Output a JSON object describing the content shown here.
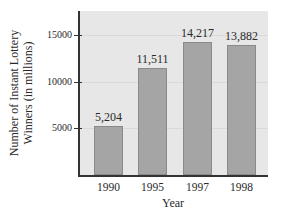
{
  "chart_data": {
    "type": "bar",
    "title": "",
    "xlabel": "Year",
    "ylabel": "Number of Instant Lottery Winners (in millions)",
    "ylabel_lines": [
      "Number of Instant Lottery",
      "Winners (in millions)"
    ],
    "categories": [
      "1990",
      "1995",
      "1997",
      "1998"
    ],
    "values": [
      5204,
      11511,
      14217,
      13882
    ],
    "value_labels": [
      "5,204",
      "11,511",
      "14,217",
      "13,882"
    ],
    "yticks": [
      5000,
      10000,
      15000
    ],
    "ytick_labels": [
      "5000",
      "10000",
      "15000"
    ],
    "ylim": [
      0,
      17500
    ],
    "grid": true,
    "legend": null
  },
  "colors": {
    "bar": "#a5a5a5",
    "plot_background": "#e7e7e7",
    "axis": "#333333"
  }
}
